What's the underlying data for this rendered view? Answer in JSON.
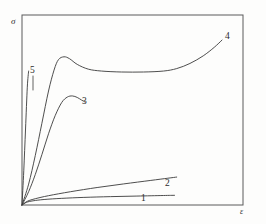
{
  "chart_data": {
    "type": "line",
    "title": "",
    "subtitle": "",
    "xlabel": "ε",
    "ylabel": "σ",
    "grid": false,
    "legend_position": "inline-end-labels",
    "axis_style": "box-frame",
    "xlim": [
      0,
      1
    ],
    "ylim": [
      0,
      1
    ],
    "x_ticks": [],
    "y_ticks": [],
    "annotations": [
      {
        "text": "1",
        "x": 0.55,
        "y": 0.055
      },
      {
        "text": "2",
        "x": 0.655,
        "y": 0.135
      },
      {
        "text": "3",
        "x": 0.272,
        "y": 0.565
      },
      {
        "text": "4",
        "x": 0.921,
        "y": 0.885
      },
      {
        "text": "5",
        "x": 0.036,
        "y": 0.725
      }
    ],
    "series": [
      {
        "name": "1",
        "label": "1",
        "color": "#3a3a3a",
        "description": "nearly flat, slightly concave curve just above the strain axis",
        "points": [
          [
            0.0,
            0.0
          ],
          [
            0.02,
            0.014
          ],
          [
            0.05,
            0.022
          ],
          [
            0.1,
            0.029
          ],
          [
            0.18,
            0.035
          ],
          [
            0.28,
            0.04
          ],
          [
            0.4,
            0.044
          ],
          [
            0.52,
            0.047
          ],
          [
            0.64,
            0.05
          ],
          [
            0.69,
            0.051
          ]
        ]
      },
      {
        "name": "2",
        "label": "2",
        "color": "#3a3a3a",
        "description": "gently rising near-linear curve above curve 1",
        "points": [
          [
            0.0,
            0.0
          ],
          [
            0.025,
            0.02
          ],
          [
            0.06,
            0.033
          ],
          [
            0.12,
            0.049
          ],
          [
            0.22,
            0.07
          ],
          [
            0.34,
            0.092
          ],
          [
            0.46,
            0.111
          ],
          [
            0.58,
            0.129
          ],
          [
            0.66,
            0.141
          ],
          [
            0.7,
            0.147
          ]
        ]
      },
      {
        "name": "3",
        "label": "3",
        "color": "#3a3a3a",
        "description": "steep rise to a rounded peak then slight decline, terminates mid-plot",
        "points": [
          [
            0.0,
            0.0
          ],
          [
            0.03,
            0.07
          ],
          [
            0.06,
            0.16
          ],
          [
            0.09,
            0.265
          ],
          [
            0.12,
            0.375
          ],
          [
            0.15,
            0.47
          ],
          [
            0.18,
            0.54
          ],
          [
            0.205,
            0.568
          ],
          [
            0.228,
            0.576
          ],
          [
            0.15,
            0.47
          ]
        ],
        "points_full": [
          [
            0.0,
            0.0
          ],
          [
            0.03,
            0.07
          ],
          [
            0.06,
            0.16
          ],
          [
            0.09,
            0.265
          ],
          [
            0.12,
            0.375
          ],
          [
            0.15,
            0.47
          ],
          [
            0.18,
            0.54
          ],
          [
            0.205,
            0.568
          ],
          [
            0.228,
            0.574
          ],
          [
            0.25,
            0.566
          ],
          [
            0.27,
            0.552
          ],
          [
            0.285,
            0.542
          ]
        ]
      },
      {
        "name": "4",
        "label": "4",
        "color": "#3a3a3a",
        "description": "steep rise to upper yield peak, drop to long flat plateau, then final upturn",
        "points": [
          [
            0.0,
            0.0
          ],
          [
            0.03,
            0.11
          ],
          [
            0.06,
            0.26
          ],
          [
            0.09,
            0.43
          ],
          [
            0.12,
            0.6
          ],
          [
            0.145,
            0.71
          ],
          [
            0.165,
            0.765
          ],
          [
            0.19,
            0.78
          ],
          [
            0.215,
            0.77
          ],
          [
            0.25,
            0.74
          ],
          [
            0.3,
            0.715
          ],
          [
            0.36,
            0.705
          ],
          [
            0.45,
            0.7
          ],
          [
            0.55,
            0.7
          ],
          [
            0.64,
            0.705
          ],
          [
            0.7,
            0.718
          ],
          [
            0.76,
            0.745
          ],
          [
            0.82,
            0.785
          ],
          [
            0.87,
            0.83
          ],
          [
            0.905,
            0.868
          ]
        ]
      },
      {
        "name": "5",
        "label": "5",
        "color": "#3a3a3a",
        "description": "very steep, almost vertical short line ending abruptly (brittle response)",
        "points": [
          [
            0.0,
            0.0
          ],
          [
            0.008,
            0.18
          ],
          [
            0.016,
            0.4
          ],
          [
            0.024,
            0.62
          ],
          [
            0.03,
            0.705
          ]
        ]
      }
    ],
    "frame": {
      "color": "#5a5a5a",
      "left": 22,
      "top": 15,
      "right": 243,
      "bottom": 205
    },
    "background_color": "#fdfdfc"
  }
}
